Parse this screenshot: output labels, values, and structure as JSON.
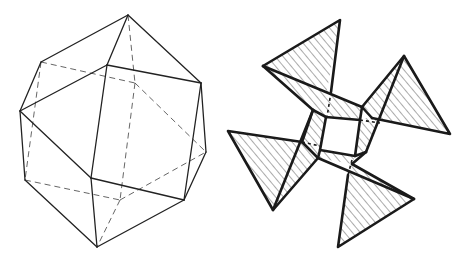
{
  "figure": {
    "panels": [
      {
        "id": "polyhedron",
        "description": "Wireframe polyhedron with visible solid edges and hidden dashed edges",
        "style": {
          "solid_color": "#222222",
          "hidden_color": "#555555"
        },
        "vertices": {
          "top": [
            128,
            15
          ],
          "upper_left": [
            41,
            62
          ],
          "front_top": [
            107,
            65
          ],
          "left": [
            20,
            111
          ],
          "right_upper": [
            201,
            83
          ],
          "right": [
            206,
            152
          ],
          "lower_left": [
            25,
            180
          ],
          "front_bottom": [
            91,
            178
          ],
          "right_lower": [
            184,
            200
          ],
          "bottom": [
            97,
            247
          ],
          "back_center_top": [
            135,
            83
          ],
          "back_center_bottom": [
            120,
            200
          ]
        }
      },
      {
        "id": "pinwheel",
        "description": "Four hatched triangular blades arranged around a central square opening",
        "style": {
          "stroke_color": "#1a1a1a",
          "hatch_color": "#444444"
        },
        "inner_square": [
          [
            326,
            117
          ],
          [
            360,
            120
          ],
          [
            355,
            156
          ],
          [
            320,
            150
          ]
        ],
        "blades": [
          {
            "name": "top",
            "tip": [
              340,
              20
            ],
            "outer": [
              263,
              66
            ]
          },
          {
            "name": "right",
            "tip": [
              404,
              56
            ],
            "outer": [
              450,
              134
            ]
          },
          {
            "name": "left",
            "tip": [
              228,
              131
            ],
            "outer": [
              273,
              210
            ]
          },
          {
            "name": "bottom",
            "tip": [
              414,
              199
            ],
            "outer": [
              338,
              247
            ]
          }
        ]
      }
    ]
  }
}
